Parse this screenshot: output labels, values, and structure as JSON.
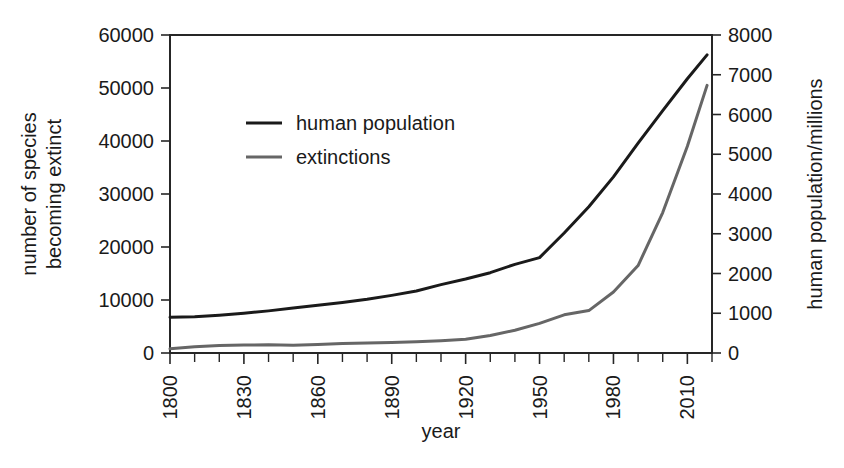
{
  "chart_data": {
    "type": "line",
    "title": "",
    "xlabel": "year",
    "ylabel_left": "number of species becoming extinct",
    "ylabel_left_line1": "number of species",
    "ylabel_left_line2": "becoming extinct",
    "ylabel_right": "human population/millions",
    "grid": false,
    "legend_position": "upper-left-inside",
    "xlim": [
      1800,
      2020
    ],
    "x_major_step": 30,
    "x_minor_step": 10,
    "x_ticklabels": [
      "1800",
      "1830",
      "1860",
      "1890",
      "1920",
      "1950",
      "1980",
      "2010"
    ],
    "x_tickvalues": [
      1800,
      1830,
      1860,
      1890,
      1920,
      1950,
      1980,
      2010
    ],
    "ylim_left": [
      0,
      60000
    ],
    "y_left_ticklabels": [
      "0",
      "10000",
      "20000",
      "30000",
      "40000",
      "50000",
      "60000"
    ],
    "y_left_tickvalues": [
      0,
      10000,
      20000,
      30000,
      40000,
      50000,
      60000
    ],
    "ylim_right": [
      0,
      8000
    ],
    "y_right_ticklabels": [
      "0",
      "1000",
      "2000",
      "3000",
      "4000",
      "5000",
      "6000",
      "7000",
      "8000"
    ],
    "y_right_tickvalues": [
      0,
      1000,
      2000,
      3000,
      4000,
      5000,
      6000,
      7000,
      8000
    ],
    "series": [
      {
        "name": "human population",
        "legend_label": "human population",
        "color": "#1a1a1a",
        "axis": "right",
        "unit": "millions",
        "x": [
          1800,
          1810,
          1820,
          1830,
          1840,
          1850,
          1860,
          1870,
          1880,
          1890,
          1900,
          1910,
          1920,
          1930,
          1940,
          1950,
          1960,
          1970,
          1980,
          1990,
          2000,
          2010,
          2018
        ],
        "values": [
          900,
          910,
          950,
          1000,
          1060,
          1130,
          1200,
          1270,
          1350,
          1450,
          1560,
          1720,
          1860,
          2020,
          2230,
          2400,
          3020,
          3680,
          4430,
          5280,
          6100,
          6900,
          7500
        ]
      },
      {
        "name": "extinctions",
        "legend_label": "extinctions",
        "color": "#666666",
        "axis": "left",
        "unit": "species",
        "x": [
          1800,
          1810,
          1820,
          1830,
          1840,
          1850,
          1860,
          1870,
          1880,
          1890,
          1900,
          1910,
          1920,
          1930,
          1940,
          1950,
          1960,
          1970,
          1980,
          1990,
          2000,
          2010,
          2018
        ],
        "values": [
          800,
          1200,
          1400,
          1500,
          1550,
          1450,
          1600,
          1800,
          1900,
          2000,
          2100,
          2300,
          2600,
          3300,
          4300,
          5600,
          7200,
          8000,
          11500,
          16500,
          26500,
          39000,
          50500
        ]
      }
    ]
  },
  "legend": {
    "entries": [
      {
        "label": "human population",
        "color": "#1a1a1a"
      },
      {
        "label": "extinctions",
        "color": "#666666"
      }
    ]
  },
  "axes": {
    "x_title": "year",
    "y_left_title_line1": "number of species",
    "y_left_title_line2": "becoming extinct",
    "y_right_title": "human population/millions"
  }
}
